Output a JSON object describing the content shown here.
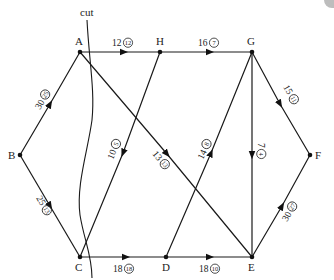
{
  "diagram": {
    "type": "flow-network",
    "cut_label": "cut",
    "nodes": [
      {
        "id": "A",
        "label": "A",
        "x": 80,
        "y": 52,
        "lx": 75,
        "ly": 45
      },
      {
        "id": "H",
        "label": "H",
        "x": 160,
        "y": 52,
        "lx": 156,
        "ly": 45
      },
      {
        "id": "G",
        "label": "G",
        "x": 252,
        "y": 52,
        "lx": 247,
        "ly": 45
      },
      {
        "id": "B",
        "label": "B",
        "x": 20,
        "y": 155,
        "lx": 8,
        "ly": 159
      },
      {
        "id": "F",
        "label": "F",
        "x": 310,
        "y": 155,
        "lx": 315,
        "ly": 159
      },
      {
        "id": "C",
        "label": "C",
        "x": 80,
        "y": 257,
        "lx": 75,
        "ly": 271
      },
      {
        "id": "D",
        "label": "D",
        "x": 166,
        "y": 257,
        "lx": 162,
        "ly": 271
      },
      {
        "id": "E",
        "label": "E",
        "x": 252,
        "y": 257,
        "lx": 248,
        "ly": 271
      }
    ],
    "edges": [
      {
        "from": "A",
        "to": "H",
        "capacity": "12",
        "flow": "12"
      },
      {
        "from": "H",
        "to": "G",
        "capacity": "16",
        "flow": "7"
      },
      {
        "from": "B",
        "to": "A",
        "capacity": "30",
        "flow": "25"
      },
      {
        "from": "B",
        "to": "C",
        "capacity": "25",
        "flow": "13"
      },
      {
        "from": "H",
        "to": "C",
        "capacity": "10",
        "flow": "5"
      },
      {
        "from": "A",
        "to": "E",
        "capacity": "13",
        "flow": "13"
      },
      {
        "from": "D",
        "to": "G",
        "capacity": "14",
        "flow": "8"
      },
      {
        "from": "G",
        "to": "E",
        "capacity": "7",
        "flow": "4"
      },
      {
        "from": "G",
        "to": "F",
        "capacity": "15",
        "flow": "11"
      },
      {
        "from": "E",
        "to": "F",
        "capacity": "30",
        "flow": "27"
      },
      {
        "from": "C",
        "to": "D",
        "capacity": "18",
        "flow": "18"
      },
      {
        "from": "D",
        "to": "E",
        "capacity": "18",
        "flow": "10"
      }
    ]
  },
  "labels": {
    "AH": {
      "cap": "12",
      "flow": "12"
    },
    "HG": {
      "cap": "16",
      "flow": "7"
    },
    "BA": {
      "cap": "30",
      "flow": "25"
    },
    "BC": {
      "cap": "25",
      "flow": "13"
    },
    "HC": {
      "cap": "10",
      "flow": "5"
    },
    "AE": {
      "cap": "13",
      "flow": "13"
    },
    "DG": {
      "cap": "14",
      "flow": "8"
    },
    "GE": {
      "cap": "7",
      "flow": "4"
    },
    "GF": {
      "cap": "15",
      "flow": "11"
    },
    "EF": {
      "cap": "30",
      "flow": "27"
    },
    "CD": {
      "cap": "18",
      "flow": "18"
    },
    "DE": {
      "cap": "18",
      "flow": "10"
    }
  },
  "node_labels": {
    "A": "A",
    "H": "H",
    "G": "G",
    "B": "B",
    "F": "F",
    "C": "C",
    "D": "D",
    "E": "E"
  },
  "cut": {
    "label": "cut"
  }
}
